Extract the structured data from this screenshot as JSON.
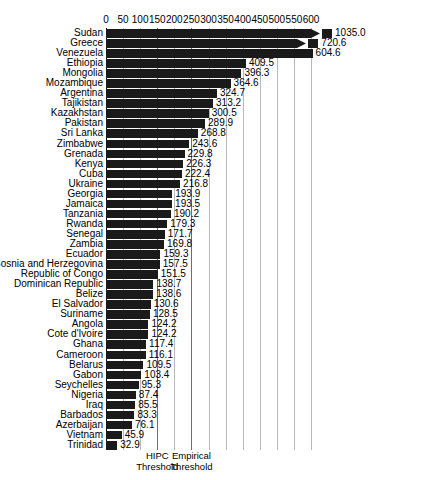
{
  "chart_data": {
    "type": "bar",
    "orientation": "horizontal",
    "title": "",
    "xlabel": "",
    "ylabel": "",
    "xlim": [
      0,
      620
    ],
    "grid": true,
    "legend": "none",
    "xticks": [
      0,
      50,
      100,
      150,
      200,
      250,
      300,
      350,
      400,
      450,
      500,
      550,
      600
    ],
    "xtick_labels": [
      "0",
      "50",
      "100",
      "150",
      "200",
      "250",
      "300",
      "350",
      "400",
      "450",
      "500",
      "550",
      "600"
    ],
    "categories": [
      "Sudan",
      "Greece",
      "Venezuela",
      "Ethiopia",
      "Mongolia",
      "Mozambique",
      "Argentina",
      "Tajikistan",
      "Kazakhstan",
      "Pakistan",
      "Sri Lanka",
      "Zimbabwe",
      "Grenada",
      "Kenya",
      "Cuba",
      "Ukraine",
      "Georgia",
      "Jamaica",
      "Tanzania",
      "Rwanda",
      "Senegal",
      "Zambia",
      "Ecuador",
      "Bosnia and Herzegovina",
      "Republic of Congo",
      "Dominican Republic",
      "Belize",
      "El Salvador",
      "Suriname",
      "Angola",
      "Cote d'Ivoire",
      "Ghana",
      "Cameroon",
      "Belarus",
      "Gabon",
      "Seychelles",
      "Nigeria",
      "Iraq",
      "Barbados",
      "Azerbaijan",
      "Vietnam",
      "Trinidad"
    ],
    "values": [
      1035.0,
      720.6,
      604.6,
      409.5,
      396.3,
      364.6,
      324.7,
      313.2,
      300.5,
      289.9,
      268.8,
      243.6,
      229.8,
      226.3,
      222.4,
      216.8,
      193.9,
      193.5,
      190.2,
      179.3,
      171.7,
      169.8,
      159.3,
      157.5,
      151.5,
      138.7,
      138.6,
      130.6,
      128.5,
      124.2,
      124.2,
      117.4,
      116.1,
      109.5,
      103.4,
      95.3,
      87.4,
      85.5,
      83.3,
      76.1,
      45.9,
      32.9
    ],
    "value_labels": [
      "1035.0",
      "720.6",
      "604.6",
      "409.5",
      "396.3",
      "364.6",
      "324.7",
      "313.2",
      "300.5",
      "289.9",
      "268.8",
      "243.6",
      "229.8",
      "226.3",
      "222.4",
      "216.8",
      "193.9",
      "193.5",
      "190.2",
      "179.3",
      "171.7",
      "169.8",
      "159.3",
      "157.5",
      "151.5",
      "138.7",
      "138.6",
      "130.6",
      "128.5",
      "124.2",
      "124.2",
      "117.4",
      "116.1",
      "109.5",
      "103.4",
      "95.3",
      "87.4",
      "85.5",
      "83.3",
      "76.1",
      "45.9",
      "32.9"
    ],
    "truncated_bars": [
      "Sudan",
      "Greece"
    ],
    "annotations": [
      {
        "name": "hipc-threshold",
        "label_line1": "HIPC",
        "label_line2": "Threshold",
        "x_value": 150
      },
      {
        "name": "empirical-threshold",
        "label_line1": "Empirical",
        "label_line2": "Threshold",
        "x_value": 250
      }
    ],
    "colors": {
      "bar": "#1a1a1a",
      "gridline": "#b8b8b8",
      "threshold_line": "#6e6e6e",
      "background": "#ffffff",
      "text": "#000000"
    }
  }
}
